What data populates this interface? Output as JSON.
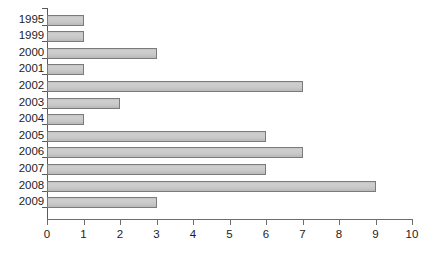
{
  "chart_data": {
    "type": "bar",
    "orientation": "horizontal",
    "title": "",
    "subtitle": "",
    "xlabel": "",
    "ylabel": "",
    "categories": [
      "1995",
      "1999",
      "2000",
      "2001",
      "2002",
      "2003",
      "2004",
      "2005",
      "2006",
      "2007",
      "2008",
      "2009"
    ],
    "values": [
      1,
      1,
      3,
      1,
      7,
      2,
      1,
      6,
      7,
      6,
      9,
      3
    ],
    "xlim": [
      0,
      10
    ],
    "xticks": [
      "0",
      "1",
      "2",
      "3",
      "4",
      "5",
      "6",
      "7",
      "8",
      "9",
      "10"
    ],
    "grid": false,
    "legend": null,
    "bar_fill_color": "#c9c9c9",
    "bar_border_color": "#7b7b7b",
    "axis_color": "#5a5a5a",
    "background_color": "#ffffff",
    "text_color": "#1d1d1d"
  }
}
